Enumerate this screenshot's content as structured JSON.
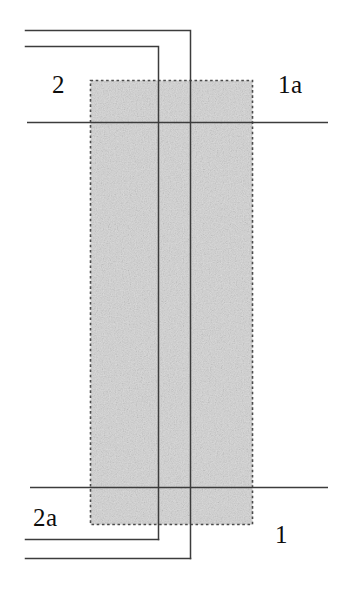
{
  "figure": {
    "type": "technical-line-drawing",
    "width": 346,
    "height": 593,
    "background_color": "#ffffff",
    "line_color": "#3c3c3c",
    "label_color": "#0d0d0d",
    "hatched_region": {
      "name": "shaded-block",
      "fill_color": "#c8c8c8",
      "border_style": "dotted",
      "border_color": "#4a4a4a",
      "x": 90,
      "y": 80,
      "width": 163,
      "height": 445
    },
    "reference_lines": [
      {
        "name": "upper-reference-line",
        "x1": 27,
        "y1": 122,
        "x2": 328,
        "y2": 122
      },
      {
        "name": "lower-reference-line",
        "x1": 30,
        "y1": 487,
        "x2": 328,
        "y2": 487
      }
    ],
    "lead_lines": [
      {
        "name": "lead-1a",
        "label": "1a",
        "horizontal_y": 30,
        "horizontal_x_start": 25,
        "corner_x": 190,
        "vertical_y_end": 558
      },
      {
        "name": "lead-2",
        "label": "2",
        "horizontal_y": 46,
        "horizontal_x_start": 25,
        "corner_x": 158,
        "vertical_y_end": 539
      },
      {
        "name": "lead-2a",
        "label": "2a",
        "horizontal_y": 539,
        "horizontal_x_start": 25,
        "corner_x": 158
      },
      {
        "name": "lead-1",
        "label": "1",
        "horizontal_y": 558,
        "horizontal_x_start": 25,
        "corner_x": 190
      }
    ],
    "labels": {
      "top_left": "2",
      "top_right": "1a",
      "bottom_left": "2a",
      "bottom_right": "1"
    }
  }
}
